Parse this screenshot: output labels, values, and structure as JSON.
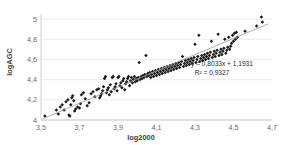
{
  "chart_data": {
    "type": "scatter",
    "title": "",
    "xlabel": "log2000",
    "ylabel": "logAGC",
    "xlim": [
      3.5,
      4.7
    ],
    "ylim": [
      4.0,
      5.05
    ],
    "xticks": [
      "3,5",
      "3,7",
      "3,9",
      "4,1",
      "4,3",
      "4,5",
      "4,7"
    ],
    "xtick_values": [
      3.5,
      3.7,
      3.9,
      4.1,
      4.3,
      4.5,
      4.7
    ],
    "yticks": [
      "4",
      "4,2",
      "4,4",
      "4,6",
      "4,8",
      "5"
    ],
    "ytick_values": [
      4.0,
      4.2,
      4.4,
      4.6,
      4.8,
      5.0
    ],
    "grid": "horizontal",
    "legend": "none",
    "marker_style": "diamond",
    "marker_color": "#1a1a1a",
    "trendline_color": "#9a9a9a",
    "gridline_color": "#e2e2e2",
    "annotations": {
      "equation": "y = 0,8033x + 1,1931",
      "r_squared": "R² = 0,9327"
    },
    "fit": {
      "slope": 0.8033,
      "intercept": 1.1931,
      "r2": 0.9327
    },
    "points": [
      [
        3.52,
        4.04
      ],
      [
        3.58,
        4.1
      ],
      [
        3.59,
        4.06
      ],
      [
        3.6,
        4.13
      ],
      [
        3.61,
        4.15
      ],
      [
        3.62,
        4.1
      ],
      [
        3.63,
        4.18
      ],
      [
        3.64,
        4.2
      ],
      [
        3.645,
        4.05
      ],
      [
        3.65,
        4.04
      ],
      [
        3.655,
        4.15
      ],
      [
        3.66,
        4.22
      ],
      [
        3.665,
        4.24
      ],
      [
        3.67,
        4.19
      ],
      [
        3.675,
        4.09
      ],
      [
        3.68,
        4.11
      ],
      [
        3.69,
        4.13
      ],
      [
        3.7,
        4.12
      ],
      [
        3.705,
        4.16
      ],
      [
        3.71,
        4.25
      ],
      [
        3.72,
        4.27
      ],
      [
        3.73,
        4.21
      ],
      [
        3.74,
        4.14
      ],
      [
        3.75,
        4.17
      ],
      [
        3.76,
        4.26
      ],
      [
        3.77,
        4.28
      ],
      [
        3.78,
        4.23
      ],
      [
        3.79,
        4.3
      ],
      [
        3.8,
        4.31
      ],
      [
        3.805,
        4.22
      ],
      [
        3.81,
        4.24
      ],
      [
        3.815,
        4.26
      ],
      [
        3.82,
        4.29
      ],
      [
        3.825,
        4.33
      ],
      [
        3.83,
        4.41
      ],
      [
        3.835,
        4.43
      ],
      [
        3.84,
        4.27
      ],
      [
        3.845,
        4.3
      ],
      [
        3.85,
        4.32
      ],
      [
        3.855,
        4.25
      ],
      [
        3.86,
        4.35
      ],
      [
        3.865,
        4.28
      ],
      [
        3.87,
        4.42
      ],
      [
        3.875,
        4.43
      ],
      [
        3.88,
        4.31
      ],
      [
        3.885,
        4.33
      ],
      [
        3.89,
        4.36
      ],
      [
        3.895,
        4.29
      ],
      [
        3.9,
        4.42
      ],
      [
        3.905,
        4.43
      ],
      [
        3.91,
        4.34
      ],
      [
        3.915,
        4.37
      ],
      [
        3.92,
        4.32
      ],
      [
        3.925,
        4.39
      ],
      [
        3.93,
        4.41
      ],
      [
        3.935,
        4.3
      ],
      [
        3.94,
        4.36
      ],
      [
        3.945,
        4.38
      ],
      [
        3.95,
        4.41
      ],
      [
        3.955,
        4.43
      ],
      [
        3.96,
        4.34
      ],
      [
        3.965,
        4.39
      ],
      [
        3.97,
        4.42
      ],
      [
        3.975,
        4.37
      ],
      [
        3.98,
        4.4
      ],
      [
        3.985,
        4.43
      ],
      [
        3.99,
        4.38
      ],
      [
        3.995,
        4.41
      ],
      [
        4.0,
        4.39
      ],
      [
        4.005,
        4.42
      ],
      [
        4.01,
        4.57
      ],
      [
        4.015,
        4.4
      ],
      [
        4.02,
        4.43
      ],
      [
        4.025,
        4.41
      ],
      [
        4.03,
        4.44
      ],
      [
        4.035,
        4.42
      ],
      [
        4.04,
        4.45
      ],
      [
        4.045,
        4.64
      ],
      [
        4.05,
        4.43
      ],
      [
        4.055,
        4.46
      ],
      [
        4.06,
        4.44
      ],
      [
        4.065,
        4.47
      ],
      [
        4.07,
        4.42
      ],
      [
        4.075,
        4.45
      ],
      [
        4.08,
        4.48
      ],
      [
        4.085,
        4.43
      ],
      [
        4.09,
        4.46
      ],
      [
        4.095,
        4.49
      ],
      [
        4.1,
        4.44
      ],
      [
        4.105,
        4.47
      ],
      [
        4.11,
        4.5
      ],
      [
        4.115,
        4.45
      ],
      [
        4.12,
        4.48
      ],
      [
        4.125,
        4.51
      ],
      [
        4.13,
        4.46
      ],
      [
        4.135,
        4.49
      ],
      [
        4.14,
        4.52
      ],
      [
        4.145,
        4.47
      ],
      [
        4.15,
        4.5
      ],
      [
        4.155,
        4.53
      ],
      [
        4.16,
        4.48
      ],
      [
        4.165,
        4.51
      ],
      [
        4.17,
        4.54
      ],
      [
        4.175,
        4.49
      ],
      [
        4.18,
        4.52
      ],
      [
        4.185,
        4.55
      ],
      [
        4.19,
        4.5
      ],
      [
        4.195,
        4.53
      ],
      [
        4.2,
        4.56
      ],
      [
        4.205,
        4.51
      ],
      [
        4.21,
        4.54
      ],
      [
        4.215,
        4.57
      ],
      [
        4.22,
        4.52
      ],
      [
        4.225,
        4.55
      ],
      [
        4.23,
        4.58
      ],
      [
        4.235,
        4.63
      ],
      [
        4.24,
        4.53
      ],
      [
        4.245,
        4.56
      ],
      [
        4.25,
        4.59
      ],
      [
        4.255,
        4.54
      ],
      [
        4.26,
        4.57
      ],
      [
        4.265,
        4.6
      ],
      [
        4.27,
        4.55
      ],
      [
        4.275,
        4.58
      ],
      [
        4.28,
        4.61
      ],
      [
        4.285,
        4.56
      ],
      [
        4.29,
        4.59
      ],
      [
        4.295,
        4.62
      ],
      [
        4.3,
        4.75
      ],
      [
        4.305,
        4.57
      ],
      [
        4.31,
        4.6
      ],
      [
        4.315,
        4.63
      ],
      [
        4.32,
        4.84
      ],
      [
        4.325,
        4.58
      ],
      [
        4.33,
        4.61
      ],
      [
        4.335,
        4.64
      ],
      [
        4.34,
        4.59
      ],
      [
        4.345,
        4.62
      ],
      [
        4.35,
        4.65
      ],
      [
        4.355,
        4.6
      ],
      [
        4.36,
        4.63
      ],
      [
        4.365,
        4.66
      ],
      [
        4.37,
        4.61
      ],
      [
        4.375,
        4.64
      ],
      [
        4.38,
        4.67
      ],
      [
        4.385,
        4.78
      ],
      [
        4.39,
        4.62
      ],
      [
        4.395,
        4.65
      ],
      [
        4.4,
        4.68
      ],
      [
        4.405,
        4.63
      ],
      [
        4.41,
        4.66
      ],
      [
        4.415,
        4.69
      ],
      [
        4.42,
        4.85
      ],
      [
        4.425,
        4.64
      ],
      [
        4.43,
        4.67
      ],
      [
        4.435,
        4.7
      ],
      [
        4.44,
        4.65
      ],
      [
        4.445,
        4.68
      ],
      [
        4.45,
        4.71
      ],
      [
        4.455,
        4.8
      ],
      [
        4.46,
        4.66
      ],
      [
        4.465,
        4.69
      ],
      [
        4.47,
        4.72
      ],
      [
        4.475,
        4.82
      ],
      [
        4.48,
        4.7
      ],
      [
        4.485,
        4.73
      ],
      [
        4.49,
        4.76
      ],
      [
        4.495,
        4.84
      ],
      [
        4.5,
        4.78
      ],
      [
        4.505,
        4.86
      ],
      [
        4.51,
        4.8
      ],
      [
        4.515,
        4.87
      ],
      [
        4.52,
        4.82
      ],
      [
        4.56,
        4.88
      ],
      [
        4.62,
        4.93
      ],
      [
        4.645,
        5.02
      ],
      [
        4.65,
        4.97
      ]
    ]
  }
}
